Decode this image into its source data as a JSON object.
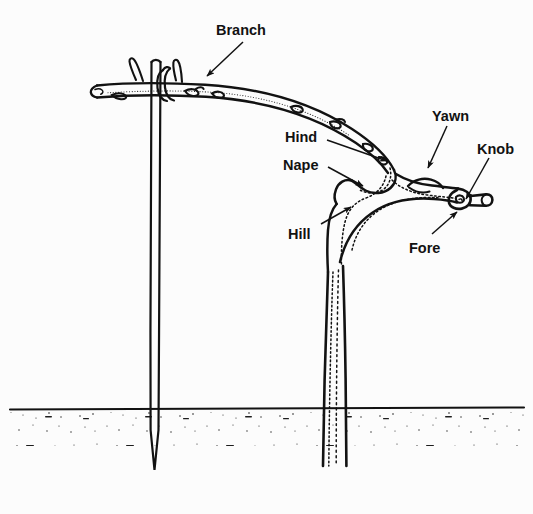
{
  "figure": {
    "type": "line-art botanical diagram",
    "background_color": "#fcfcfc",
    "ink_color": "#121212"
  },
  "labels": [
    {
      "id": "branch",
      "text": "Branch",
      "x": 216,
      "y": 22,
      "anchor": "start",
      "leader": {
        "from": [
          243,
          42
        ],
        "to": [
          207,
          76
        ],
        "arrow": true
      }
    },
    {
      "id": "yawn",
      "text": "Yawn",
      "x": 432,
      "y": 108,
      "anchor": "start",
      "leader": {
        "from": [
          447,
          126
        ],
        "to": [
          428,
          168
        ],
        "arrow": true
      }
    },
    {
      "id": "knob",
      "text": "Knob",
      "x": 477,
      "y": 141,
      "anchor": "start",
      "leader": {
        "from": [
          489,
          158
        ],
        "to": [
          466,
          199
        ],
        "arrow": true
      }
    },
    {
      "id": "hind",
      "text": "Hind",
      "x": 285,
      "y": 129,
      "anchor": "start",
      "leader": {
        "from": [
          327,
          140
        ],
        "to": [
          387,
          161
        ],
        "arrow": true
      }
    },
    {
      "id": "nape",
      "text": "Nape",
      "x": 283,
      "y": 157,
      "anchor": "start",
      "leader": {
        "from": [
          328,
          167
        ],
        "to": [
          363,
          186
        ],
        "arrow": true
      }
    },
    {
      "id": "hill",
      "text": "Hill",
      "x": 288,
      "y": 226,
      "anchor": "start",
      "leader": {
        "from": [
          321,
          224
        ],
        "to": [
          351,
          207
        ],
        "arrow": true
      }
    },
    {
      "id": "fore",
      "text": "Fore",
      "x": 409,
      "y": 240,
      "anchor": "start",
      "leader": {
        "from": [
          432,
          234
        ],
        "to": [
          457,
          212
        ],
        "arrow": true
      }
    }
  ],
  "parts": {
    "stake": {
      "name": "vertical stake",
      "top_y": 60,
      "bottom_y": 462
    },
    "ground_line": {
      "name": "soil surface line",
      "y": 409
    },
    "trunk": {
      "name": "vertical leader trunk"
    },
    "branch_arc": {
      "name": "arched trained branch"
    },
    "knob_stub": {
      "name": "pruned knob stub"
    }
  },
  "caption": {
    "text": ""
  }
}
